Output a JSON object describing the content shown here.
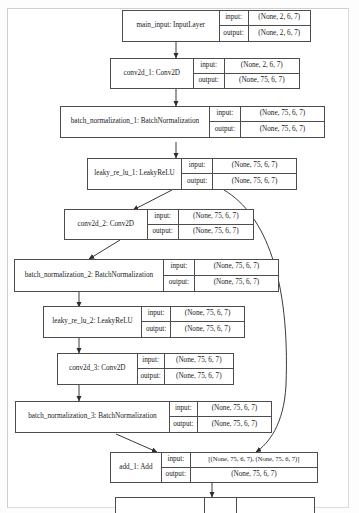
{
  "diagram": {
    "io_labels": {
      "input": "input:",
      "output": "output:"
    },
    "colors": {
      "node_border": "#4d4d4d",
      "edge": "#3a3a3a",
      "page_border": "#dcdcdc",
      "background": "#ffffff"
    },
    "nodes": [
      {
        "id": "main_input",
        "label": "main_input: InputLayer",
        "input": "(None, 2, 6, 7)",
        "output": "(None, 2, 6, 7)"
      },
      {
        "id": "conv2d_1",
        "label": "conv2d_1: Conv2D",
        "input": "(None, 2, 6, 7)",
        "output": "(None, 75, 6, 7)"
      },
      {
        "id": "batch_normalization_1",
        "label": "batch_normalization_1: BatchNormalization",
        "input": "(None, 75, 6, 7)",
        "output": "(None, 75, 6, 7)"
      },
      {
        "id": "leaky_re_lu_1",
        "label": "leaky_re_lu_1: LeakyReLU",
        "input": "(None, 75, 6, 7)",
        "output": "(None, 75, 6, 7)"
      },
      {
        "id": "conv2d_2",
        "label": "conv2d_2: Conv2D",
        "input": "(None, 75, 6, 7)",
        "output": "(None, 75, 6, 7)"
      },
      {
        "id": "batch_normalization_2",
        "label": "batch_normalization_2: BatchNormalization",
        "input": "(None, 75, 6, 7)",
        "output": "(None, 75, 6, 7)"
      },
      {
        "id": "leaky_re_lu_2",
        "label": "leaky_re_lu_2: LeakyReLU",
        "input": "(None, 75, 6, 7)",
        "output": "(None, 75, 6, 7)"
      },
      {
        "id": "conv2d_3",
        "label": "conv2d_3: Conv2D",
        "input": "(None, 75, 6, 7)",
        "output": "(None, 75, 6, 7)"
      },
      {
        "id": "batch_normalization_3",
        "label": "batch_normalization_3: BatchNormalization",
        "input": "(None, 75, 6, 7)",
        "output": "(None, 75, 6, 7)"
      },
      {
        "id": "add_1",
        "label": "add_1: Add",
        "input": "[(None, 75, 6, 7), (None, 75, 6, 7)]",
        "output": "(None, 75, 6, 7)"
      }
    ],
    "edges": [
      {
        "from": "main_input",
        "to": "conv2d_1"
      },
      {
        "from": "conv2d_1",
        "to": "batch_normalization_1"
      },
      {
        "from": "batch_normalization_1",
        "to": "leaky_re_lu_1"
      },
      {
        "from": "leaky_re_lu_1",
        "to": "conv2d_2"
      },
      {
        "from": "leaky_re_lu_1",
        "to": "add_1",
        "type": "skip-connection"
      },
      {
        "from": "conv2d_2",
        "to": "batch_normalization_2"
      },
      {
        "from": "batch_normalization_2",
        "to": "leaky_re_lu_2"
      },
      {
        "from": "leaky_re_lu_2",
        "to": "conv2d_3"
      },
      {
        "from": "conv2d_3",
        "to": "batch_normalization_3"
      },
      {
        "from": "batch_normalization_3",
        "to": "add_1"
      },
      {
        "from": "add_1",
        "to": "next_layer_clipped"
      }
    ]
  }
}
